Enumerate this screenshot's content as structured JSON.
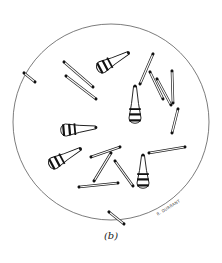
{
  "figure": {
    "caption": "(b)",
    "signature": "R. DURRANT",
    "field": {
      "cx": 111,
      "cy": 122,
      "r": 98,
      "stroke": "#444444"
    },
    "rods": [
      {
        "x1": 24,
        "y1": 73,
        "x2": 35,
        "y2": 82
      },
      {
        "x1": 64,
        "y1": 62,
        "x2": 93,
        "y2": 87
      },
      {
        "x1": 66,
        "y1": 76,
        "x2": 96,
        "y2": 99
      },
      {
        "x1": 153,
        "y1": 54,
        "x2": 140,
        "y2": 84
      },
      {
        "x1": 150,
        "y1": 72,
        "x2": 163,
        "y2": 99
      },
      {
        "x1": 157,
        "y1": 79,
        "x2": 171,
        "y2": 105
      },
      {
        "x1": 172,
        "y1": 71,
        "x2": 173,
        "y2": 103
      },
      {
        "x1": 178,
        "y1": 109,
        "x2": 172,
        "y2": 133
      },
      {
        "x1": 149,
        "y1": 153,
        "x2": 185,
        "y2": 147
      },
      {
        "x1": 91,
        "y1": 157,
        "x2": 120,
        "y2": 147
      },
      {
        "x1": 111,
        "y1": 153,
        "x2": 94,
        "y2": 181
      },
      {
        "x1": 115,
        "y1": 161,
        "x2": 133,
        "y2": 186
      },
      {
        "x1": 79,
        "y1": 187,
        "x2": 118,
        "y2": 183
      },
      {
        "x1": 109,
        "y1": 212,
        "x2": 124,
        "y2": 224
      }
    ],
    "spores": [
      {
        "x": 102,
        "y": 67,
        "angle": -28,
        "len": 30
      },
      {
        "x": 66,
        "y": 130,
        "angle": -5,
        "len": 30
      },
      {
        "x": 54,
        "y": 163,
        "angle": -28,
        "len": 30
      },
      {
        "x": 135,
        "y": 118,
        "angle": -90,
        "len": 32
      },
      {
        "x": 143,
        "y": 183,
        "angle": -90,
        "len": 28
      }
    ]
  }
}
